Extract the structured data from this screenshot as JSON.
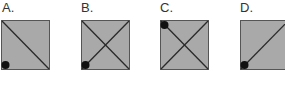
{
  "colors": {
    "fill": "#a9a9a9",
    "stroke": "#2a2a2a",
    "dot": "#111111",
    "label": "#333333"
  },
  "options": [
    {
      "label": "A.",
      "lines": [
        "top-left-to-bottom-right"
      ],
      "dot": "bottom-left"
    },
    {
      "label": "B.",
      "lines": [
        "top-left-to-bottom-right",
        "top-right-to-bottom-left"
      ],
      "dot": "bottom-left"
    },
    {
      "label": "C.",
      "lines": [
        "top-left-to-bottom-right",
        "top-right-to-bottom-left"
      ],
      "dot": "top-left"
    },
    {
      "label": "D.",
      "lines": [
        "top-right-to-bottom-left"
      ],
      "dot": "bottom-left"
    }
  ]
}
